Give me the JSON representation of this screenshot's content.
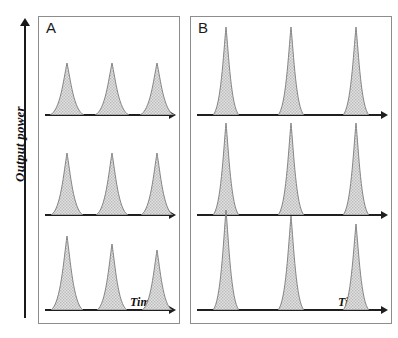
{
  "figure": {
    "background": "#ffffff",
    "axis_color": "#1f1f1f",
    "panel_border_color": "#8d8d8d",
    "pulse_fill": "#d6d6d6",
    "pulse_stroke": "#7a7a7a"
  },
  "axes": {
    "y_label": "Output power",
    "x_label": "Time"
  },
  "panels": [
    {
      "id": "A",
      "label": "A",
      "x_label": "Time"
    },
    {
      "id": "B",
      "label": "B",
      "x_label": "Time"
    }
  ],
  "chart_data": {
    "type": "line",
    "title": "",
    "xlabel": "Time",
    "ylabel": "Output power",
    "grid": false,
    "legend": "none",
    "panels": [
      {
        "name": "A",
        "traces": [
          {
            "trace_index": 1,
            "baseline_y": 99,
            "pulses": [
              {
                "center": 28,
                "height": 52,
                "half_width": 17
              },
              {
                "center": 73,
                "height": 52,
                "half_width": 17
              },
              {
                "center": 118,
                "height": 52,
                "half_width": 17
              }
            ]
          },
          {
            "trace_index": 2,
            "baseline_y": 199,
            "pulses": [
              {
                "center": 28,
                "height": 62,
                "half_width": 16
              },
              {
                "center": 73,
                "height": 62,
                "half_width": 16
              },
              {
                "center": 118,
                "height": 62,
                "half_width": 16
              }
            ]
          },
          {
            "trace_index": 3,
            "baseline_y": 294,
            "pulses": [
              {
                "center": 28,
                "height": 74,
                "half_width": 16
              },
              {
                "center": 73,
                "height": 66,
                "half_width": 15
              },
              {
                "center": 118,
                "height": 60,
                "half_width": 15
              }
            ]
          }
        ]
      },
      {
        "name": "B",
        "traces": [
          {
            "trace_index": 1,
            "baseline_y": 99,
            "pulses": [
              {
                "center": 35,
                "height": 88,
                "half_width": 13
              },
              {
                "center": 100,
                "height": 88,
                "half_width": 13
              },
              {
                "center": 165,
                "height": 88,
                "half_width": 13
              }
            ]
          },
          {
            "trace_index": 2,
            "baseline_y": 199,
            "pulses": [
              {
                "center": 35,
                "height": 92,
                "half_width": 13
              },
              {
                "center": 100,
                "height": 92,
                "half_width": 13
              },
              {
                "center": 165,
                "height": 92,
                "half_width": 13
              }
            ]
          },
          {
            "trace_index": 3,
            "baseline_y": 294,
            "pulses": [
              {
                "center": 35,
                "height": 100,
                "half_width": 13
              },
              {
                "center": 100,
                "height": 94,
                "half_width": 13
              },
              {
                "center": 165,
                "height": 86,
                "half_width": 13
              }
            ]
          }
        ]
      }
    ]
  }
}
